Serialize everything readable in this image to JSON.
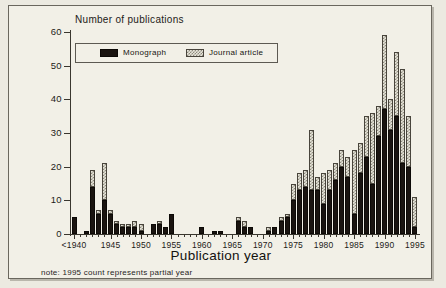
{
  "chart_data": {
    "type": "bar",
    "title": "",
    "ylabel": "Number of publications",
    "xlabel": "Publication year",
    "ylim": [
      0,
      60
    ],
    "yticks": [
      0,
      10,
      20,
      30,
      40,
      50,
      60
    ],
    "xticks": [
      "<1940",
      "1945",
      "1950",
      "1955",
      "1960",
      "1965",
      "1970",
      "1975",
      "1980",
      "1985",
      "1990",
      "1995"
    ],
    "grid": false,
    "stacked": true,
    "legend_position": "top-left",
    "categories": [
      "<1940",
      "1940",
      "1941",
      "1942",
      "1943",
      "1944",
      "1945",
      "1946",
      "1947",
      "1948",
      "1949",
      "1950",
      "1951",
      "1952",
      "1953",
      "1954",
      "1955",
      "1956",
      "1957",
      "1958",
      "1959",
      "1960",
      "1961",
      "1962",
      "1963",
      "1964",
      "1965",
      "1966",
      "1967",
      "1968",
      "1969",
      "1970",
      "1971",
      "1972",
      "1973",
      "1974",
      "1975",
      "1976",
      "1977",
      "1978",
      "1979",
      "1980",
      "1981",
      "1982",
      "1983",
      "1984",
      "1985",
      "1986",
      "1987",
      "1988",
      "1989",
      "1990",
      "1991",
      "1992",
      "1993",
      "1994",
      "1995"
    ],
    "series": [
      {
        "name": "Monograph",
        "color": "#1a1410",
        "values": [
          5,
          0,
          1,
          14,
          6,
          10,
          6,
          3,
          2,
          2,
          2,
          1,
          0,
          3,
          3,
          2,
          6,
          0,
          0,
          0,
          0,
          2,
          0,
          1,
          1,
          0,
          0,
          4,
          2,
          2,
          0,
          0,
          1,
          2,
          4,
          5,
          10,
          13,
          14,
          13,
          13,
          9,
          13,
          16,
          20,
          17,
          6,
          18,
          23,
          15,
          29,
          37,
          31,
          35,
          21,
          20,
          2
        ]
      },
      {
        "name": "Journal article",
        "color": "#8f8b7e",
        "values": [
          0,
          0,
          0,
          5,
          1,
          11,
          1,
          1,
          1,
          1,
          2,
          2,
          0,
          0,
          1,
          0,
          0,
          0,
          0,
          0,
          0,
          0,
          0,
          0,
          0,
          0,
          0,
          1,
          2,
          0,
          0,
          0,
          1,
          0,
          1,
          1,
          5,
          5,
          5,
          18,
          4,
          9,
          6,
          5,
          5,
          6,
          19,
          9,
          12,
          21,
          9,
          22,
          9,
          19,
          28,
          15,
          9
        ]
      }
    ],
    "totals": [
      5,
      0,
      1,
      19,
      7,
      21,
      7,
      4,
      3,
      3,
      4,
      3,
      0,
      3,
      4,
      2,
      6,
      0,
      0,
      0,
      0,
      2,
      0,
      1,
      1,
      0,
      0,
      5,
      4,
      2,
      0,
      0,
      2,
      2,
      5,
      6,
      15,
      18,
      19,
      31,
      17,
      18,
      19,
      21,
      25,
      23,
      25,
      27,
      35,
      36,
      38,
      59,
      40,
      54,
      49,
      35,
      11
    ],
    "note": "note: 1995 count represents partial year"
  },
  "legend": {
    "monograph_label": "Monograph",
    "journal_label": "Journal article"
  }
}
